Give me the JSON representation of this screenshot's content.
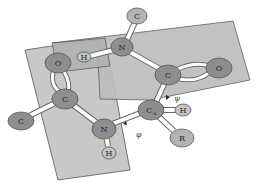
{
  "diagram": {
    "type": "peptide-backbone-dihedral-angles",
    "planes": [
      {
        "name": "peptide-plane-left"
      },
      {
        "name": "peptide-plane-right"
      }
    ],
    "atoms": {
      "c_top": "C",
      "n_top": "N",
      "h_top": "H",
      "o_left": "O",
      "c_carbonyl_left": "C",
      "c_far_left": "C",
      "n_bottom": "N",
      "h_bottom": "H",
      "c_carbonyl_right": "C",
      "o_right": "O",
      "c_alpha": "C",
      "c_alpha_sub": "α",
      "h_right": "H",
      "r_group": "R"
    },
    "angles": {
      "psi": "ψ",
      "phi": "φ"
    },
    "colors": {
      "plane": "#c8c8c8",
      "atom_dark": "#8e8e8e",
      "atom_light": "#b4b4b4",
      "bond": "#ffffff"
    }
  }
}
